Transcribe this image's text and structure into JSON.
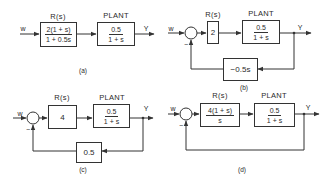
{
  "figure": {
    "panels": [
      {
        "id": "a",
        "caption": "(a)",
        "input_label": "w",
        "output_label": "Y",
        "controller": {
          "title": "R(s)",
          "numerator": "2(1 + s)",
          "denominator": "1 + 0.5s"
        },
        "plant": {
          "title": "PLANT",
          "numerator": "0.5",
          "denominator": "1 + s"
        },
        "feedback": null
      },
      {
        "id": "b",
        "caption": "(b)",
        "input_label": "w",
        "output_label": "Y",
        "summing_sign": "−",
        "controller": {
          "title": "R(s)",
          "value": "2"
        },
        "plant": {
          "title": "PLANT",
          "numerator": "0.5",
          "denominator": "1 + s"
        },
        "feedback": {
          "value": "−0.5s"
        }
      },
      {
        "id": "c",
        "caption": "(c)",
        "input_label": "w",
        "output_label": "Y",
        "summing_sign": "−",
        "controller": {
          "title": "R(s)",
          "value": "4"
        },
        "plant": {
          "title": "PLANT",
          "numerator": "0.5",
          "denominator": "1 + s"
        },
        "feedback": {
          "value": "0.5"
        }
      },
      {
        "id": "d",
        "caption": "(d)",
        "input_label": "w",
        "output_label": "Y",
        "summing_sign": "−",
        "controller": {
          "title": "R(s)",
          "numerator": "4(1 + s)",
          "denominator": "s"
        },
        "plant": {
          "title": "PLANT",
          "numerator": "0.5",
          "denominator": "1 + s"
        },
        "feedback": {
          "value": "unity"
        }
      }
    ],
    "colors": {
      "line": "#333333",
      "background": "#ffffff"
    }
  }
}
